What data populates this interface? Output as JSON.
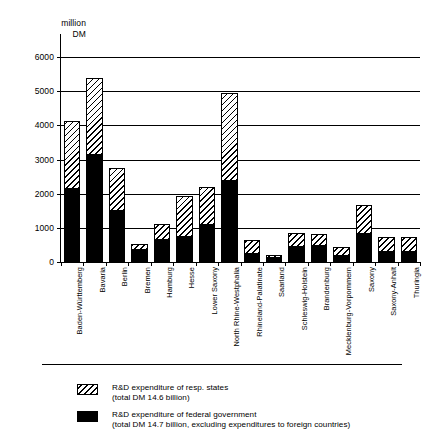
{
  "chart_data": {
    "type": "bar",
    "subtype": "stacked-vertical",
    "title": "",
    "xlabel": "",
    "ylabel": "million DM",
    "ylim": [
      0,
      6000
    ],
    "yticks": [
      0,
      1000,
      2000,
      3000,
      4000,
      5000,
      6000
    ],
    "ytick_labels": [
      "0",
      "1000",
      "2000",
      "3000",
      "4000",
      "5000",
      "6000"
    ],
    "grid": true,
    "legend_position": "bottom-left",
    "categories": [
      "Baden-Württemberg",
      "Bavaria",
      "Berlin",
      "Bremen",
      "Hamburg",
      "Hesse",
      "Lower Saxony",
      "North Rhine-Westphalia",
      "Rhineland-Palatinate",
      "Saarland",
      "Schleswig-Holstein",
      "Brandenburg",
      "Mecklenburg-Vorpommern",
      "Saxony",
      "Saxony-Anhalt",
      "Thuringia"
    ],
    "series": [
      {
        "name": "R&D expenditure of federal government",
        "key": "federal",
        "fill": "solid-black",
        "color": "#000000",
        "values": [
          2150,
          3130,
          1480,
          360,
          650,
          740,
          1080,
          2360,
          220,
          110,
          440,
          460,
          190,
          810,
          290,
          280
        ]
      },
      {
        "name": "R&D expenditure of resp. states",
        "key": "state",
        "fill": "diagonal-hatch",
        "color": "#ffffff",
        "values": [
          1990,
          2270,
          1280,
          170,
          470,
          1180,
          1120,
          2600,
          430,
          90,
          420,
          350,
          260,
          860,
          440,
          450
        ]
      }
    ],
    "totals": [
      4140,
      5400,
      2760,
      530,
      1120,
      1920,
      2200,
      4960,
      650,
      200,
      860,
      810,
      450,
      1670,
      730,
      730
    ]
  },
  "axis": {
    "unit_line1": "million",
    "unit_line2": "DM"
  },
  "legend": {
    "items": [
      {
        "swatch": "hatched-swatch",
        "label": "R&D expenditure of resp. states",
        "sub": "(total DM 14.6 billion)"
      },
      {
        "swatch": "solid-black-swatch",
        "label": "R&D expenditure of federal government",
        "sub": "(total DM 14.7 billion, excluding expenditures to foreign countries)"
      }
    ]
  }
}
